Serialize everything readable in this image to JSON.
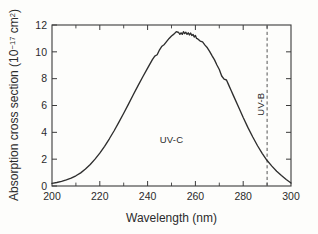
{
  "chart_data": {
    "type": "line",
    "title": "",
    "xlabel": "Wavelength (nm)",
    "ylabel_prefix": "Absorption cross section (10",
    "ylabel_exponent": "−17",
    "ylabel_suffix": " cm",
    "ylabel_sup2": "2",
    "ylabel_close": ")",
    "ylabel_full": "Absorption cross section (10−17 cm2)",
    "xlim": [
      200,
      300
    ],
    "ylim": [
      0,
      12
    ],
    "xticks": [
      200,
      220,
      240,
      260,
      280,
      300
    ],
    "xtick_labels": [
      "200",
      "220",
      "240",
      "260",
      "280",
      "300"
    ],
    "xminor_ticks": [
      210,
      230,
      250,
      270,
      290
    ],
    "yticks": [
      0,
      2,
      4,
      6,
      8,
      10,
      12
    ],
    "ytick_labels": [
      "0",
      "2",
      "4",
      "6",
      "8",
      "10",
      "12"
    ],
    "grid": false,
    "legend": false,
    "x": [
      200,
      202,
      204,
      206,
      208,
      210,
      212,
      214,
      216,
      218,
      220,
      222,
      224,
      226,
      228,
      230,
      232,
      234,
      236,
      238,
      240,
      242,
      243,
      244,
      245,
      246,
      247,
      248,
      249,
      250,
      251,
      252,
      253,
      253.5,
      254,
      254.5,
      255,
      255.5,
      256,
      256.5,
      257,
      257.5,
      258,
      258.5,
      259,
      259.5,
      260,
      260.5,
      261,
      262,
      263,
      264,
      265,
      266,
      267,
      268,
      269,
      270,
      271,
      272,
      273,
      274,
      275,
      276,
      278,
      280,
      282,
      284,
      286,
      288,
      290,
      292,
      294,
      296,
      298,
      300
    ],
    "values": [
      0.2,
      0.26,
      0.34,
      0.45,
      0.58,
      0.76,
      0.98,
      1.26,
      1.6,
      2.0,
      2.45,
      2.96,
      3.52,
      4.12,
      4.76,
      5.42,
      6.1,
      6.8,
      7.48,
      8.14,
      8.78,
      9.42,
      9.68,
      9.78,
      10.15,
      10.42,
      10.55,
      10.78,
      11.0,
      11.18,
      11.32,
      11.5,
      11.44,
      11.3,
      11.42,
      11.3,
      11.5,
      11.36,
      11.46,
      11.3,
      11.42,
      11.26,
      11.4,
      11.22,
      11.3,
      11.1,
      11.22,
      11.0,
      10.96,
      10.8,
      10.74,
      10.5,
      10.3,
      10.02,
      9.7,
      9.4,
      9.02,
      8.68,
      8.2,
      7.96,
      7.9,
      7.5,
      7.1,
      6.7,
      5.9,
      5.1,
      4.35,
      3.65,
      3.0,
      2.42,
      1.9,
      1.48,
      1.1,
      0.78,
      0.48,
      0.22
    ],
    "annotations": [
      {
        "name": "uv-c-label",
        "text": "UV-C",
        "x": 250,
        "y": 3.2,
        "rotation": 0
      },
      {
        "name": "uv-b-label",
        "text": "UV-B",
        "x": 288.5,
        "y": 6.1,
        "rotation": -90
      }
    ],
    "reference_lines": [
      {
        "name": "uv-b-boundary",
        "x": 290,
        "style": "dashed"
      }
    ]
  }
}
